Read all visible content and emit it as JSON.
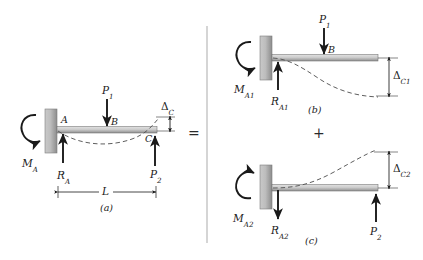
{
  "figure": {
    "kind": "beam-superposition-diagram",
    "panels": [
      {
        "id": "a",
        "caption": "(a)",
        "labels": {
          "moment": "M",
          "moment_sub": "A",
          "reaction": "R",
          "reaction_sub": "A",
          "load1": "P",
          "load1_sub": "1",
          "load2": "P",
          "load2_sub": "2",
          "point_a": "A",
          "point_b": "B",
          "point_c": "C",
          "deflection": "Δ",
          "deflection_sub": "C",
          "length": "L"
        }
      },
      {
        "id": "b",
        "caption": "(b)",
        "labels": {
          "moment": "M",
          "moment_sub": "A1",
          "reaction": "R",
          "reaction_sub": "A1",
          "load1": "P",
          "load1_sub": "1",
          "point_b": "B",
          "deflection": "Δ",
          "deflection_sub": "C1"
        }
      },
      {
        "id": "c",
        "caption": "(c)",
        "labels": {
          "moment": "M",
          "moment_sub": "A2",
          "reaction": "R",
          "reaction_sub": "A2",
          "load2": "P",
          "load2_sub": "2",
          "deflection": "Δ",
          "deflection_sub": "C2"
        }
      }
    ],
    "operators": {
      "equals": "=",
      "plus": "+"
    },
    "colors": {
      "beam_top": "#d9d9d9",
      "beam_bottom": "#8e8e8e",
      "wall_light": "#cfcfcf",
      "wall_dark": "#8a8a8a",
      "ink": "#1a1a1a",
      "dashed": "#4a4a4a",
      "bracket": "#b0b0b0"
    }
  }
}
